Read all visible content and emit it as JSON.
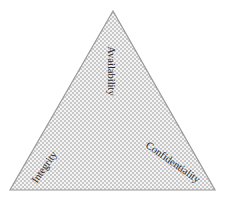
{
  "diagram": {
    "type": "triangle",
    "title": "",
    "vertices": {
      "top": "Availability",
      "bottom_left": "Integrity",
      "bottom_right": "Confidentiality"
    },
    "labels": [
      {
        "id": "availability",
        "text": "Availability"
      },
      {
        "id": "integrity",
        "text": "Integrity"
      },
      {
        "id": "confidentiality",
        "text": "Confidentiality"
      }
    ],
    "colors": {
      "edge": "#9a9a9a",
      "pattern_dark": "#c4c4c4",
      "pattern_light": "#f4f4f4",
      "text": "#2a2a2a"
    }
  }
}
